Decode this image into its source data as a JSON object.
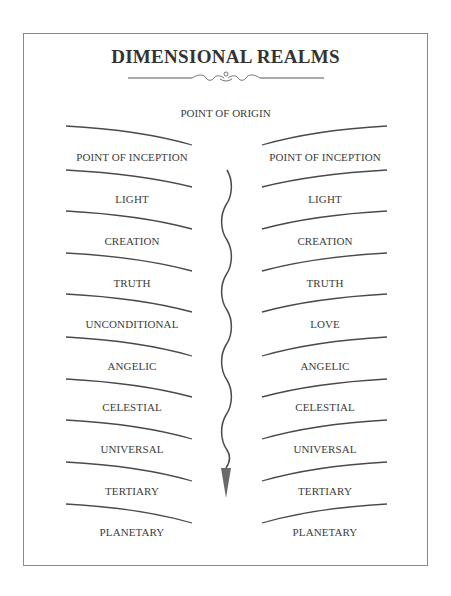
{
  "title": "DIMENSIONAL REALMS",
  "top_label": "POINT OF ORIGIN",
  "left_column": [
    "POINT OF INCEPTION",
    "LIGHT",
    "CREATION",
    "TRUTH",
    "UNCONDITIONAL",
    "ANGELIC",
    "CELESTIAL",
    "UNIVERSAL",
    "TERTIARY",
    "PLANETARY"
  ],
  "right_column": [
    "POINT OF INCEPTION",
    "LIGHT",
    "CREATION",
    "TRUTH",
    "LOVE",
    "ANGELIC",
    "CELESTIAL",
    "UNIVERSAL",
    "TERTIARY",
    "PLANETARY"
  ],
  "center_arrow": {
    "direction": "down",
    "style": "wavy"
  },
  "colors": {
    "line": "#4a4a4a",
    "text": "#3c3c3c",
    "arrow_head": "#6a6a6a",
    "frame": "#8a8a8a"
  }
}
